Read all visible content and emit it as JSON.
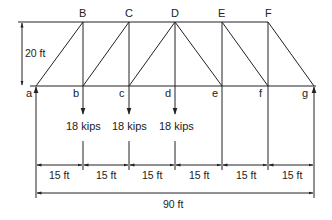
{
  "diagram": {
    "type": "truss",
    "top_nodes": [
      {
        "id": "B",
        "label": "B"
      },
      {
        "id": "C",
        "label": "C"
      },
      {
        "id": "D",
        "label": "D"
      },
      {
        "id": "E",
        "label": "E"
      },
      {
        "id": "F",
        "label": "F"
      }
    ],
    "bottom_nodes": [
      {
        "id": "a",
        "label": "a"
      },
      {
        "id": "b",
        "label": "b"
      },
      {
        "id": "c",
        "label": "c"
      },
      {
        "id": "d",
        "label": "d"
      },
      {
        "id": "e",
        "label": "e"
      },
      {
        "id": "f",
        "label": "f"
      },
      {
        "id": "g",
        "label": "g"
      }
    ],
    "loads": [
      {
        "node": "b",
        "label": "18 kips"
      },
      {
        "node": "c",
        "label": "18 kips"
      },
      {
        "node": "d",
        "label": "18 kips"
      }
    ],
    "height_dimension": "20 ft",
    "panel_dimensions": [
      "15 ft",
      "15 ft",
      "15 ft",
      "15 ft",
      "15 ft",
      "15 ft"
    ],
    "total_dimension": "90 ft",
    "supports": [
      "a",
      "g"
    ]
  }
}
